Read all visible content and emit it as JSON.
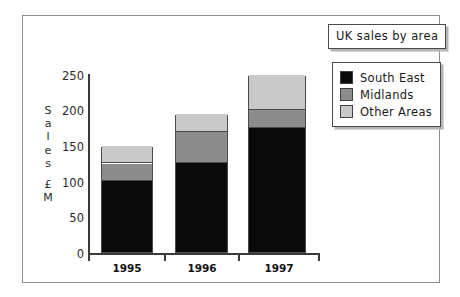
{
  "chart_data": {
    "type": "bar",
    "subtype": "stacked-column",
    "title": "UK sales by area",
    "xlabel": "",
    "ylabel": "Sales £M",
    "ylabel_chars": [
      "S",
      "a",
      "l",
      "e",
      "s",
      "£",
      "M"
    ],
    "categories": [
      "1995",
      "1996",
      "1997"
    ],
    "series": [
      {
        "name": "South East",
        "values": [
          100,
          125,
          175
        ],
        "color": "#0a0a0a"
      },
      {
        "name": "Midlands",
        "values": [
          25,
          45,
          25
        ],
        "color": "#8c8c8c"
      },
      {
        "name": "Other Areas",
        "values": [
          25,
          25,
          50
        ],
        "color": "#c9c9c9"
      }
    ],
    "cumulative_tops": [
      [
        100,
        125,
        150
      ],
      [
        125,
        170,
        195
      ],
      [
        175,
        200,
        250
      ]
    ],
    "totals": [
      150,
      195,
      250
    ],
    "ylim": [
      0,
      250
    ],
    "ytick_values": [
      0,
      50,
      100,
      150,
      200,
      250
    ],
    "ytick_labels": [
      "0",
      "50",
      "100",
      "150",
      "200",
      "250"
    ],
    "grid": false,
    "legend_position": "top-right",
    "units": "£M"
  },
  "legend": {
    "items": [
      {
        "label": "South East",
        "color": "#0a0a0a"
      },
      {
        "label": "Midlands",
        "color": "#8c8c8c"
      },
      {
        "label": "Other Areas",
        "color": "#c9c9c9"
      }
    ]
  },
  "colors": {
    "south_east": "#0a0a0a",
    "midlands": "#8c8c8c",
    "other_areas": "#c9c9c9",
    "frame": "#8d8d8d",
    "axis": "#3a3a3a",
    "shadow": "#b4b4b4",
    "background": "#ffffff"
  }
}
